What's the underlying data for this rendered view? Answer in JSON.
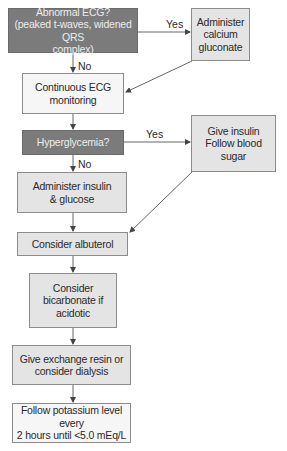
{
  "diagram": {
    "type": "flowchart",
    "nodes": [
      {
        "id": "n1",
        "kind": "decision",
        "text": "Abnormal ECG?\n(peaked t-waves, widened QRS\ncomplex)"
      },
      {
        "id": "n2",
        "kind": "action",
        "text": "Administer\ncalcium\ngluconate"
      },
      {
        "id": "n3",
        "kind": "light",
        "text": "Continuous ECG\nmonitoring"
      },
      {
        "id": "n4",
        "kind": "decision",
        "text": "Hyperglycemia?"
      },
      {
        "id": "n5",
        "kind": "action",
        "text": "Give insulin\nFollow blood\nsugar"
      },
      {
        "id": "n6",
        "kind": "action",
        "text": "Administer insulin\n& glucose"
      },
      {
        "id": "n7",
        "kind": "action",
        "text": "Consider albuterol"
      },
      {
        "id": "n8",
        "kind": "action",
        "text": "Consider\nbicarbonate if\nacidotic"
      },
      {
        "id": "n9",
        "kind": "action",
        "text": "Give exchange resin or\nconsider dialysis"
      },
      {
        "id": "n10",
        "kind": "light",
        "text": "Follow potassium level every\n2 hours until <5.0 mEq/L"
      }
    ],
    "edge_labels": {
      "ecg_yes": "Yes",
      "ecg_no": "No",
      "hyper_yes": "Yes",
      "hyper_no": "No"
    },
    "edges": [
      {
        "from": "n1",
        "to": "n2",
        "label": "Yes"
      },
      {
        "from": "n1",
        "to": "n3",
        "label": "No"
      },
      {
        "from": "n2",
        "to": "n3",
        "label": ""
      },
      {
        "from": "n3",
        "to": "n4",
        "label": ""
      },
      {
        "from": "n4",
        "to": "n5",
        "label": "Yes"
      },
      {
        "from": "n4",
        "to": "n6",
        "label": "No"
      },
      {
        "from": "n5",
        "to": "n7",
        "label": ""
      },
      {
        "from": "n6",
        "to": "n7",
        "label": ""
      },
      {
        "from": "n7",
        "to": "n8",
        "label": ""
      },
      {
        "from": "n8",
        "to": "n9",
        "label": ""
      },
      {
        "from": "n9",
        "to": "n10",
        "label": ""
      }
    ],
    "colors": {
      "decision_fill": "#7b7b7b",
      "decision_text": "#ececec",
      "action_fill": "#e4e4e4",
      "light_fill": "#f6f6f6",
      "line": "#555555"
    }
  }
}
